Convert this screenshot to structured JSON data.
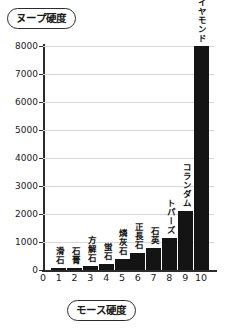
{
  "chart_data": {
    "type": "bar",
    "title": "",
    "ylabel": "ヌープ硬度",
    "xlabel": "モース硬度",
    "categories": [
      "1",
      "2",
      "3",
      "4",
      "5",
      "6",
      "7",
      "8",
      "9",
      "10"
    ],
    "bar_labels": [
      "滑石",
      "石膏",
      "方解石",
      "蛍石",
      "燐灰石",
      "正長石",
      "石英",
      "トパーズ",
      "コランダム",
      "ダイヤモンド"
    ],
    "values": [
      20,
      80,
      150,
      200,
      400,
      600,
      800,
      1150,
      2100,
      8000
    ],
    "ylim": [
      0,
      8000
    ],
    "ytick_labels": [
      "0",
      "1000",
      "2000",
      "3000",
      "4000",
      "5000",
      "6000",
      "7000",
      "8000"
    ],
    "ytick_values": [
      0,
      1000,
      2000,
      3000,
      4000,
      5000,
      6000,
      7000,
      8000
    ],
    "xtick_labels": [
      "0",
      "1",
      "2",
      "3",
      "4",
      "5",
      "6",
      "7",
      "8",
      "9",
      "10"
    ],
    "grid": true,
    "legend": "none",
    "bar_color": "#141414",
    "axis_color": "#2b2b2b",
    "grid_color": "#d8d8d8"
  }
}
